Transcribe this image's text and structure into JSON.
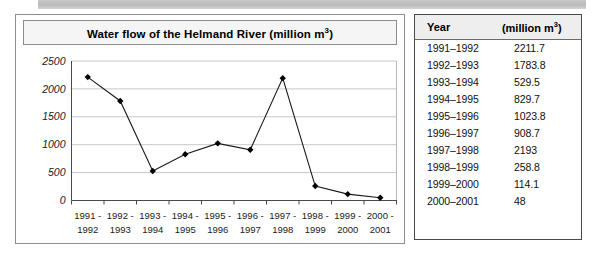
{
  "chart_panel": {
    "title": "Water flow of the Helmand River (million m",
    "title_sup": "3",
    "title_suffix": ")"
  },
  "table": {
    "headers": {
      "year": "Year",
      "value_prefix": "(million m",
      "value_sup": "3",
      "value_suffix": ")"
    },
    "rows": [
      {
        "year": "1991–1992",
        "value": "2211.7"
      },
      {
        "year": "1992–1993",
        "value": "1783.8"
      },
      {
        "year": "1993–1994",
        "value": "529.5"
      },
      {
        "year": "1994–1995",
        "value": "829.7"
      },
      {
        "year": "1995–1996",
        "value": "1023.8"
      },
      {
        "year": "1996–1997",
        "value": "908.7"
      },
      {
        "year": "1997–1998",
        "value": "2193"
      },
      {
        "year": "1998–1999",
        "value": "258.8"
      },
      {
        "year": "1999–2000",
        "value": "114.1"
      },
      {
        "year": "2000–2001",
        "value": "48"
      }
    ]
  },
  "chart_data": {
    "type": "line",
    "title": "Water flow of the Helmand River (million m3)",
    "xlabel": "",
    "ylabel": "",
    "ylim": [
      0,
      2500
    ],
    "yticks": [
      0,
      500,
      1000,
      1500,
      2000,
      2500
    ],
    "ytick_labels": [
      "0",
      "500",
      "1000",
      "1500",
      "2000",
      "2500"
    ],
    "grid": true,
    "legend": "none",
    "marker": "diamond",
    "categories": [
      "1991 - 1992",
      "1992 - 1993",
      "1993 - 1994",
      "1994 - 1995",
      "1995 - 1996",
      "1996 - 1997",
      "1997 - 1998",
      "1998 - 1999",
      "1999 - 2000",
      "2000 - 2001"
    ],
    "category_lines": [
      [
        "1991 -",
        "1992"
      ],
      [
        "1992 -",
        "1993"
      ],
      [
        "1993 -",
        "1994"
      ],
      [
        "1994 -",
        "1995"
      ],
      [
        "1995 -",
        "1996"
      ],
      [
        "1996 -",
        "1997"
      ],
      [
        "1997 -",
        "1998"
      ],
      [
        "1998 -",
        "1999"
      ],
      [
        "1999 -",
        "2000"
      ],
      [
        "2000 -",
        "2001"
      ]
    ],
    "values": [
      2211.7,
      1783.8,
      529.5,
      829.7,
      1023.8,
      908.7,
      2193,
      258.8,
      114.1,
      48
    ],
    "series": [
      {
        "name": "Water flow",
        "values": [
          2211.7,
          1783.8,
          529.5,
          829.7,
          1023.8,
          908.7,
          2193,
          258.8,
          114.1,
          48
        ]
      }
    ],
    "colors": {
      "line": "#1a1a1a",
      "marker": "#000000",
      "grid": "#c8c8c8",
      "axis": "#4a4a4a"
    }
  }
}
